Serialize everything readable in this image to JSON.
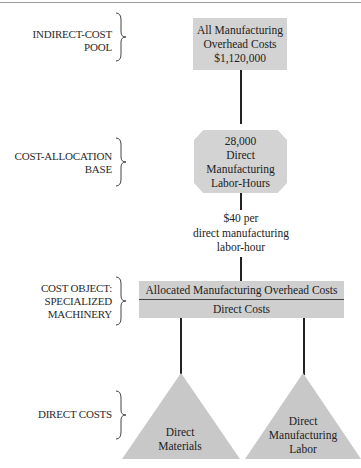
{
  "diagram": {
    "levels": [
      {
        "label_lines": [
          "INDIRECT-COST",
          "POOL"
        ],
        "node_lines": [
          "All Manufacturing",
          "Overhead Costs",
          "$1,120,000"
        ],
        "shape": "rectangle"
      },
      {
        "label_lines": [
          "COST-ALLOCATION",
          "BASE"
        ],
        "node_lines": [
          "28,000",
          "Direct",
          "Manufacturing",
          "Labor-Hours"
        ],
        "shape": "octagon"
      },
      {
        "label_lines": [
          "COST OBJECT:",
          "SPECIALIZED",
          "MACHINERY"
        ],
        "node_rows": [
          "Allocated Manufacturing Overhead Costs",
          "Direct Costs"
        ],
        "shape": "split-bar"
      },
      {
        "label_lines": [
          "DIRECT COSTS"
        ],
        "nodes": [
          {
            "lines": [
              "Direct",
              "Materials"
            ],
            "shape": "triangle"
          },
          {
            "lines": [
              "Direct",
              "Manufacturing",
              "Labor"
            ],
            "shape": "triangle"
          }
        ]
      }
    ],
    "allocation_rate_lines": [
      "$40 per",
      "direct manufacturing",
      "labor-hour"
    ],
    "colors": {
      "fill": "#d3d3d3",
      "line": "#222222",
      "text": "#222222"
    }
  }
}
